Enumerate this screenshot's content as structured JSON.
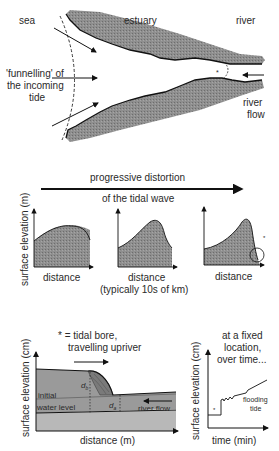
{
  "panel_a": {
    "labels": {
      "sea": "sea",
      "estuary": "estuary",
      "river": "river",
      "funnelling_line1": "'funnelling' of",
      "funnelling_line2": "the incoming",
      "funnelling_line3": "tide",
      "river_flow_line1": "river",
      "river_flow_line2": "flow",
      "bore_marker": "*"
    }
  },
  "panel_b": {
    "title_line1": "progressive distortion",
    "title_line2": "of the tidal wave",
    "y_axis_label": "surface elevation (m)",
    "charts": [
      {
        "x_label": "distance",
        "x_sublabel": ""
      },
      {
        "x_label": "distance",
        "x_sublabel": "(typically 10s of km)"
      },
      {
        "x_label": "distance",
        "x_sublabel": "",
        "marker": "*"
      }
    ]
  },
  "panel_c": {
    "legend_line1": "* = tidal bore,",
    "legend_line2": "travelling upriver",
    "y_axis_label": "surface elevation (cm)",
    "x_axis_label": "distance (m)",
    "initial_line1": "initial",
    "initial_line2": "water level",
    "d_b": "d",
    "d_b_sub": "b",
    "d_a": "d",
    "d_a_sub": "a",
    "river_flow": "river flow"
  },
  "panel_d": {
    "title_line1": "at a fixed",
    "title_line2": "location,",
    "title_line3": "over time...",
    "y_axis_label": "surface elevation (cm)",
    "x_axis_label": "time (min)",
    "bore_marker": "*",
    "flooding_line1": "flooding",
    "flooding_line2": "tide"
  },
  "colors": {
    "fill_gray": "#8c8c8c",
    "light_gray": "#bdbdbd",
    "line": "#111111"
  }
}
